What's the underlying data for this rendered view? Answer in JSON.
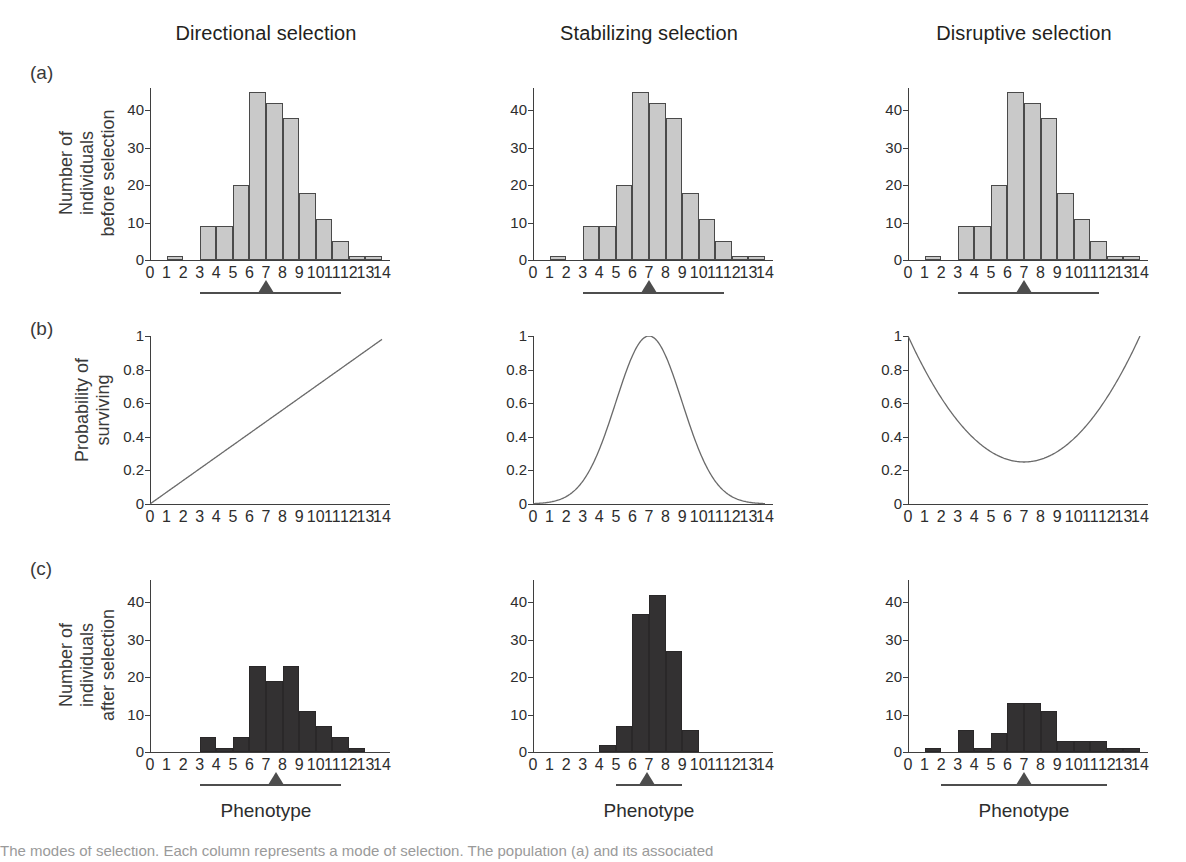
{
  "figure": {
    "columns": [
      {
        "key": "directional",
        "title": "Directional selection"
      },
      {
        "key": "stabilizing",
        "title": "Stabilizing selection"
      },
      {
        "key": "disruptive",
        "title": "Disruptive selection"
      }
    ],
    "rows": [
      {
        "tag": "(a)",
        "ytitle_line1": "Number of",
        "ytitle_line2": "individuals",
        "ytitle_line3": "before selection"
      },
      {
        "tag": "(b)",
        "ytitle_line1": "Probability of",
        "ytitle_line2": "surviving",
        "ytitle_line3": ""
      },
      {
        "tag": "(c)",
        "ytitle_line1": "Number of",
        "ytitle_line2": "individuals",
        "ytitle_line3": "after selection"
      }
    ],
    "xtitle": "Phenotype",
    "caption": "The modes of selection. Each column represents a mode of selection. The population (a) and its associated"
  },
  "colors": {
    "bar_before": "#c9c9c9",
    "bar_after": "#333132",
    "bar_stroke": "#4a4a4a",
    "axis": "#3f3f3f",
    "curve": "#6a6a6a",
    "marker": "#4d4d4d",
    "text": "#2d2d2d"
  },
  "chart_data": [
    {
      "id": "a-directional",
      "type": "bar",
      "title": "Directional selection",
      "row": "(a)",
      "xlabel": "Phenotype",
      "ylabel": "Number of individuals before selection",
      "categories": [
        "0",
        "1",
        "2",
        "3",
        "4",
        "5",
        "6",
        "7",
        "8",
        "9",
        "10",
        "11",
        "12",
        "13",
        "14"
      ],
      "bin_centers": [
        0.5,
        1.5,
        2.5,
        3.5,
        4.5,
        5.5,
        6.5,
        7.5,
        8.5,
        9.5,
        10.5,
        11.5,
        12.5,
        13.5
      ],
      "values": [
        0,
        1,
        0,
        9,
        9,
        20,
        45,
        42,
        38,
        18,
        11,
        5,
        1,
        1
      ],
      "ylim": [
        0,
        46
      ],
      "yticks": [
        0,
        10,
        20,
        30,
        40
      ],
      "xlim": [
        0,
        14
      ],
      "grid": false,
      "mean_marker": 7.0,
      "range_bar": [
        3,
        11.5
      ]
    },
    {
      "id": "a-stabilizing",
      "type": "bar",
      "title": "Stabilizing selection",
      "row": "(a)",
      "xlabel": "Phenotype",
      "ylabel": "Number of individuals before selection",
      "categories": [
        "0",
        "1",
        "2",
        "3",
        "4",
        "5",
        "6",
        "7",
        "8",
        "9",
        "10",
        "11",
        "12",
        "13",
        "14"
      ],
      "bin_centers": [
        0.5,
        1.5,
        2.5,
        3.5,
        4.5,
        5.5,
        6.5,
        7.5,
        8.5,
        9.5,
        10.5,
        11.5,
        12.5,
        13.5
      ],
      "values": [
        0,
        1,
        0,
        9,
        9,
        20,
        45,
        42,
        38,
        18,
        11,
        5,
        1,
        1
      ],
      "ylim": [
        0,
        46
      ],
      "yticks": [
        0,
        10,
        20,
        30,
        40
      ],
      "xlim": [
        0,
        14
      ],
      "grid": false,
      "mean_marker": 7.0,
      "range_bar": [
        3,
        11.5
      ]
    },
    {
      "id": "a-disruptive",
      "type": "bar",
      "title": "Disruptive selection",
      "row": "(a)",
      "xlabel": "Phenotype",
      "ylabel": "Number of individuals before selection",
      "categories": [
        "0",
        "1",
        "2",
        "3",
        "4",
        "5",
        "6",
        "7",
        "8",
        "9",
        "10",
        "11",
        "12",
        "13",
        "14"
      ],
      "bin_centers": [
        0.5,
        1.5,
        2.5,
        3.5,
        4.5,
        5.5,
        6.5,
        7.5,
        8.5,
        9.5,
        10.5,
        11.5,
        12.5,
        13.5
      ],
      "values": [
        0,
        1,
        0,
        9,
        9,
        20,
        45,
        42,
        38,
        18,
        11,
        5,
        1,
        1
      ],
      "ylim": [
        0,
        46
      ],
      "yticks": [
        0,
        10,
        20,
        30,
        40
      ],
      "xlim": [
        0,
        14
      ],
      "grid": false,
      "mean_marker": 7.0,
      "range_bar": [
        3,
        11.5
      ]
    },
    {
      "id": "b-directional",
      "type": "line",
      "title": "Directional selection",
      "row": "(b)",
      "xlabel": "Phenotype",
      "ylabel": "Probability of surviving",
      "shape": "linear-increasing",
      "x": [
        0,
        1,
        2,
        3,
        4,
        5,
        6,
        7,
        8,
        9,
        10,
        11,
        12,
        13,
        14
      ],
      "values": [
        0.0,
        0.07,
        0.14,
        0.21,
        0.28,
        0.35,
        0.42,
        0.49,
        0.56,
        0.63,
        0.7,
        0.77,
        0.84,
        0.91,
        0.98
      ],
      "ylim": [
        0,
        1
      ],
      "yticks": [
        0,
        0.2,
        0.4,
        0.6,
        0.8,
        1
      ],
      "yticklabels": [
        "0",
        "0.2",
        "0.4",
        "0.6",
        "0.8",
        "1"
      ],
      "xlim": [
        0,
        14
      ],
      "grid": false
    },
    {
      "id": "b-stabilizing",
      "type": "line",
      "title": "Stabilizing selection",
      "row": "(b)",
      "xlabel": "Phenotype",
      "ylabel": "Probability of surviving",
      "shape": "gaussian-peak",
      "peak_x": 7,
      "peak_y": 1.0,
      "sigma": 2.0,
      "x": [
        0,
        1,
        2,
        3,
        4,
        5,
        6,
        7,
        8,
        9,
        10,
        11,
        12,
        13,
        14
      ],
      "values": [
        0.007,
        0.022,
        0.066,
        0.162,
        0.325,
        0.54,
        0.82,
        1.0,
        0.82,
        0.54,
        0.325,
        0.162,
        0.066,
        0.022,
        0.007
      ],
      "ylim": [
        0,
        1
      ],
      "yticks": [
        0,
        0.2,
        0.4,
        0.6,
        0.8,
        1
      ],
      "yticklabels": [
        "0",
        "0.2",
        "0.4",
        "0.6",
        "0.8",
        "1"
      ],
      "xlim": [
        0,
        14
      ],
      "grid": false
    },
    {
      "id": "b-disruptive",
      "type": "line",
      "title": "Disruptive selection",
      "row": "(b)",
      "xlabel": "Phenotype",
      "ylabel": "Probability of surviving",
      "shape": "u-curve",
      "min_x": 7,
      "min_y": 0.25,
      "x": [
        0,
        1,
        2,
        3,
        4,
        5,
        6,
        7,
        8,
        9,
        10,
        11,
        12,
        13,
        14
      ],
      "values": [
        1.0,
        0.786,
        0.602,
        0.449,
        0.327,
        0.235,
        0.173,
        0.25,
        0.173,
        0.235,
        0.327,
        0.449,
        0.602,
        0.786,
        1.0
      ],
      "ylim": [
        0,
        1
      ],
      "yticks": [
        0,
        0.2,
        0.4,
        0.6,
        0.8,
        1
      ],
      "yticklabels": [
        "0",
        "0.2",
        "0.4",
        "0.6",
        "0.8",
        "1"
      ],
      "xlim": [
        0,
        14
      ],
      "grid": false
    },
    {
      "id": "c-directional",
      "type": "bar",
      "title": "Directional selection",
      "row": "(c)",
      "xlabel": "Phenotype",
      "ylabel": "Number of individuals after selection",
      "categories": [
        "0",
        "1",
        "2",
        "3",
        "4",
        "5",
        "6",
        "7",
        "8",
        "9",
        "10",
        "11",
        "12",
        "13",
        "14"
      ],
      "bin_centers": [
        0.5,
        1.5,
        2.5,
        3.5,
        4.5,
        5.5,
        6.5,
        7.5,
        8.5,
        9.5,
        10.5,
        11.5,
        12.5,
        13.5
      ],
      "values": [
        0,
        0,
        0,
        4,
        1,
        4,
        23,
        19,
        23,
        11,
        7,
        4,
        1,
        0
      ],
      "ylim": [
        0,
        46
      ],
      "yticks": [
        0,
        10,
        20,
        30,
        40
      ],
      "xlim": [
        0,
        14
      ],
      "grid": false,
      "mean_marker": 7.6,
      "range_bar": [
        3,
        11.5
      ]
    },
    {
      "id": "c-stabilizing",
      "type": "bar",
      "title": "Stabilizing selection",
      "row": "(c)",
      "xlabel": "Phenotype",
      "ylabel": "Number of individuals after selection",
      "categories": [
        "0",
        "1",
        "2",
        "3",
        "4",
        "5",
        "6",
        "7",
        "8",
        "9",
        "10",
        "11",
        "12",
        "13",
        "14"
      ],
      "bin_centers": [
        0.5,
        1.5,
        2.5,
        3.5,
        4.5,
        5.5,
        6.5,
        7.5,
        8.5,
        9.5,
        10.5,
        11.5,
        12.5,
        13.5
      ],
      "values": [
        0,
        0,
        0,
        0,
        2,
        7,
        37,
        42,
        27,
        6,
        0,
        0,
        0,
        0
      ],
      "ylim": [
        0,
        46
      ],
      "yticks": [
        0,
        10,
        20,
        30,
        40
      ],
      "xlim": [
        0,
        14
      ],
      "grid": false,
      "mean_marker": 6.9,
      "range_bar": [
        5,
        9
      ]
    },
    {
      "id": "c-disruptive",
      "type": "bar",
      "title": "Disruptive selection",
      "row": "(c)",
      "xlabel": "Phenotype",
      "ylabel": "Number of individuals after selection",
      "categories": [
        "0",
        "1",
        "2",
        "3",
        "4",
        "5",
        "6",
        "7",
        "8",
        "9",
        "10",
        "11",
        "12",
        "13",
        "14"
      ],
      "bin_centers": [
        0.5,
        1.5,
        2.5,
        3.5,
        4.5,
        5.5,
        6.5,
        7.5,
        8.5,
        9.5,
        10.5,
        11.5,
        12.5,
        13.5
      ],
      "values": [
        0,
        1,
        0,
        6,
        1,
        5,
        13,
        13,
        11,
        3,
        3,
        3,
        1,
        1
      ],
      "ylim": [
        0,
        46
      ],
      "yticks": [
        0,
        10,
        20,
        30,
        40
      ],
      "xlim": [
        0,
        14
      ],
      "grid": false,
      "mean_marker": 7.0,
      "range_bar": [
        2,
        12
      ]
    }
  ]
}
